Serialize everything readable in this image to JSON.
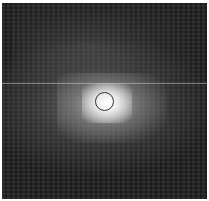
{
  "image": {
    "type": "grayscale astronomical image",
    "marker": {
      "shape": "circle",
      "center_px": [
        104,
        97
      ],
      "radius_px": 9,
      "color": "#333333"
    },
    "artifact": {
      "type": "horizontal line",
      "y_px": 83,
      "color": "#c8c8c8"
    },
    "colors": {
      "background": "#1c1c1c",
      "core": "#ffffff",
      "margin": "#ffffff"
    }
  }
}
